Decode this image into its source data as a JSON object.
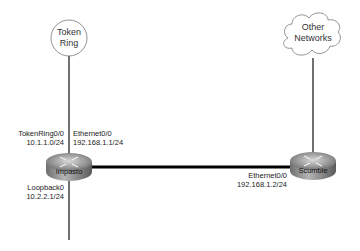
{
  "diagram": {
    "clouds": [
      {
        "id": "token-ring",
        "lines": [
          "Token",
          "Ring"
        ],
        "shape": "circle"
      },
      {
        "id": "other-networks",
        "lines": [
          "Other",
          "Networks"
        ],
        "shape": "cloud"
      }
    ],
    "routers": [
      {
        "id": "impasto",
        "name": "Impasto"
      },
      {
        "id": "scumble",
        "name": "Scumble"
      }
    ],
    "interfaces": {
      "impasto_tokenring": {
        "name": "TokenRing0/0",
        "address": "10.1.1.0/24"
      },
      "impasto_ethernet": {
        "name": "Ethernet0/0",
        "address": "192.168.1.1/24"
      },
      "impasto_loopback": {
        "name": "Loopback0",
        "address": "10.2.2.1/24"
      },
      "scumble_ethernet": {
        "name": "Ethernet0/0",
        "address": "192.168.1.2/24"
      }
    },
    "links": [
      {
        "from": "token-ring",
        "to": "impasto",
        "type": "thin"
      },
      {
        "from": "impasto",
        "to": "scumble",
        "type": "thick"
      },
      {
        "from": "other-networks",
        "to": "scumble",
        "type": "thin"
      },
      {
        "from": "impasto",
        "to": "loopback",
        "type": "thin"
      }
    ]
  }
}
